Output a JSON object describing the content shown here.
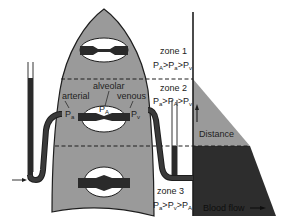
{
  "figure": {
    "colors": {
      "lung_fill": "#9a9a9a",
      "outline": "#1e1e1e",
      "vessel": "#2a2a2a",
      "alveolus": "#ffffff",
      "flow_light": "#9a9a9a",
      "flow_dark": "#2d2d2d",
      "background": "#ffffff"
    }
  },
  "zones": [
    {
      "name": "zone 1",
      "relation": {
        "p1": "P",
        "s1": "A",
        "p2": "P",
        "s2": "a",
        "p3": "P",
        "s3": "v"
      },
      "text": "PA > Pa > Pv"
    },
    {
      "name": "zone 2",
      "relation": {
        "p1": "P",
        "s1": "a",
        "p2": "P",
        "s2": "A",
        "p3": "P",
        "s3": "v"
      },
      "text": "Pa > PA > Pv"
    },
    {
      "name": "zone 3",
      "relation": {
        "p1": "P",
        "s1": "a",
        "p2": "P",
        "s2": "v",
        "p3": "P",
        "s3": "A"
      },
      "text": "Pa > Pv > PA"
    }
  ],
  "labels": {
    "alveolar": "alveolar",
    "arterial": "arterial",
    "venous": "venous",
    "pa_main": "P",
    "pa_sub": "a",
    "pA_main": "P",
    "pA_sub": "A",
    "pv_main": "P",
    "pv_sub": "v",
    "gt": ">"
  },
  "graph": {
    "y_axis_label": "Distance",
    "x_axis_label": "Blood flow",
    "x_arrow": "→",
    "y_arrow": "↑"
  }
}
